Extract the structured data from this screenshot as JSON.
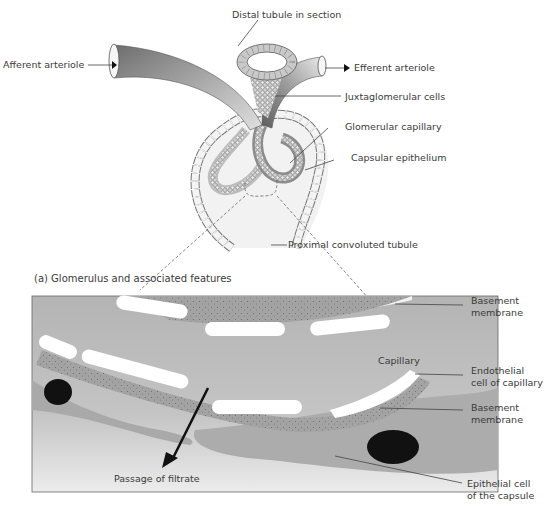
{
  "figure": {
    "top_diagram": {
      "labels": {
        "distal_tubule": "Distal tubule in section",
        "afferent_arteriole": "Afferent arteriole",
        "efferent_arteriole": "Efferent arteriole",
        "juxtaglomerular_cells": "Juxtaglomerular cells",
        "glomerular_capillary": "Glomerular capillary",
        "capsular_epithelium": "Capsular epithelium",
        "proximal_tubule": "Proximal convoluted tubule"
      }
    },
    "caption": "(a) Glomerulus and associated features",
    "bottom_diagram": {
      "labels": {
        "basement_membrane_top_1": "Basement",
        "basement_membrane_top_2": "membrane",
        "capillary": "Capillary",
        "endothelial_1": "Endothelial",
        "endothelial_2": "cell of capillary",
        "basement_membrane_bottom_1": "Basement",
        "basement_membrane_bottom_2": "membrane",
        "filtrate": "Passage of filtrate",
        "epithelial_1": "Epithelial cell",
        "epithelial_2": "of the capsule"
      }
    },
    "colors": {
      "panel_bg": "#bdbdbd",
      "membrane": "#9a9a9a",
      "cell_light": "#d9d9d9",
      "nucleus": "#111111",
      "arteriole": "#8a8a8a"
    }
  }
}
